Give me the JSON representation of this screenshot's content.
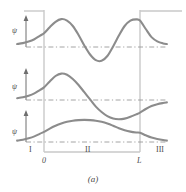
{
  "figure": {
    "caption": "(a)",
    "axis_label_psi": "ψ",
    "panels": [
      {
        "name": "panel-top",
        "axis_label": "ψ"
      },
      {
        "name": "panel-middle",
        "axis_label": "ψ"
      },
      {
        "name": "panel-bottom",
        "axis_label": "ψ"
      }
    ],
    "regions": [
      {
        "label": "I"
      },
      {
        "label": "II"
      },
      {
        "label": "III"
      }
    ],
    "x_ticks": [
      {
        "label": "0"
      },
      {
        "label": "L"
      }
    ],
    "colors": {
      "curve": "#8c8c8c",
      "zero_line": "#9a9a9a",
      "well_wall": "#c9c9c9",
      "axis": "#6e6e6e",
      "text": "#4a4a4a"
    }
  },
  "chart_data": {
    "type": "line",
    "title": "",
    "subtitle": "",
    "xlabel": "",
    "ylabel": "ψ",
    "caption": "(a)",
    "grid": false,
    "legend_position": "none",
    "x_ticks": {
      "values": [
        0,
        1
      ],
      "labels": [
        "0",
        "L"
      ]
    },
    "annotations": [
      "I",
      "II",
      "III"
    ],
    "well": {
      "left_wall_x": 0.0,
      "right_wall_x": 1.0,
      "type": "finite-square-well"
    },
    "xlim": [
      -0.28,
      1.28
    ],
    "series": [
      {
        "name": "psi-n3",
        "panel": "top",
        "nodes_inside_well": 2,
        "description": "Third bound state: oscillates with two crossings inside the well, exponential decay in regions I and III",
        "x": [
          -0.28,
          -0.22,
          -0.16,
          -0.1,
          -0.04,
          0.0,
          0.06,
          0.12,
          0.18,
          0.24,
          0.3,
          0.36,
          0.42,
          0.48,
          0.54,
          0.6,
          0.66,
          0.72,
          0.78,
          0.84,
          0.9,
          0.96,
          1.0,
          1.06,
          1.12,
          1.18,
          1.24,
          1.28
        ],
        "y": [
          0.1,
          0.13,
          0.18,
          0.26,
          0.38,
          0.46,
          0.66,
          0.84,
          0.93,
          0.88,
          0.7,
          0.4,
          0.05,
          -0.25,
          -0.44,
          -0.46,
          -0.3,
          0.02,
          0.38,
          0.7,
          0.88,
          0.92,
          0.88,
          0.6,
          0.33,
          0.19,
          0.12,
          0.1
        ]
      },
      {
        "name": "psi-n2",
        "panel": "middle",
        "nodes_inside_well": 1,
        "description": "Second bound state: antisymmetric, one node inside the well, decays toward axis in regions I and III",
        "x": [
          -0.28,
          -0.22,
          -0.16,
          -0.1,
          -0.04,
          0.0,
          0.06,
          0.12,
          0.18,
          0.24,
          0.3,
          0.36,
          0.42,
          0.48,
          0.54,
          0.6,
          0.66,
          0.72,
          0.78,
          0.84,
          0.9,
          0.96,
          1.0,
          1.06,
          1.12,
          1.18,
          1.24,
          1.28
        ],
        "y": [
          0.06,
          0.09,
          0.14,
          0.22,
          0.34,
          0.42,
          0.62,
          0.8,
          0.88,
          0.84,
          0.7,
          0.5,
          0.26,
          0.02,
          -0.22,
          -0.4,
          -0.54,
          -0.62,
          -0.64,
          -0.62,
          -0.56,
          -0.48,
          -0.42,
          -0.3,
          -0.2,
          -0.14,
          -0.1,
          -0.08
        ]
      },
      {
        "name": "psi-n1",
        "panel": "bottom",
        "nodes_inside_well": 0,
        "description": "Ground state: single broad symmetric hump, no nodes, exponential tails in regions I and III",
        "x": [
          -0.28,
          -0.22,
          -0.16,
          -0.1,
          -0.04,
          0.0,
          0.06,
          0.12,
          0.18,
          0.24,
          0.3,
          0.36,
          0.42,
          0.48,
          0.54,
          0.6,
          0.66,
          0.72,
          0.78,
          0.84,
          0.9,
          0.96,
          1.0,
          1.06,
          1.12,
          1.18,
          1.24,
          1.28
        ],
        "y": [
          0.05,
          0.08,
          0.13,
          0.2,
          0.3,
          0.36,
          0.48,
          0.58,
          0.66,
          0.72,
          0.76,
          0.78,
          0.79,
          0.78,
          0.76,
          0.72,
          0.66,
          0.58,
          0.49,
          0.42,
          0.37,
          0.34,
          0.33,
          0.24,
          0.16,
          0.11,
          0.07,
          0.05
        ]
      }
    ]
  }
}
